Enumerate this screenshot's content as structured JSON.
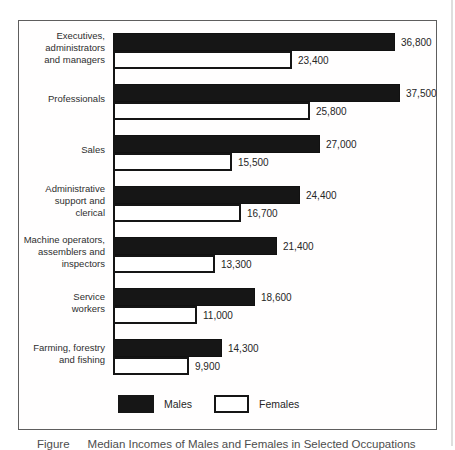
{
  "chart_data": {
    "type": "bar",
    "orientation": "horizontal",
    "categories": [
      [
        "Executives,",
        "administrators",
        "and managers"
      ],
      [
        "Professionals"
      ],
      [
        "Sales"
      ],
      [
        "Administrative",
        "support and",
        "clerical"
      ],
      [
        "Machine operators,",
        "assemblers and",
        "inspectors"
      ],
      [
        "Service",
        "workers"
      ],
      [
        "Farming, forestry",
        "and fishing"
      ]
    ],
    "series": [
      {
        "name": "Males",
        "values": [
          36800,
          37500,
          27000,
          24400,
          21400,
          18600,
          14300
        ],
        "value_labels": [
          "36,800",
          "37,500",
          "27,000",
          "24,400",
          "21,400",
          "18,600",
          "14,300"
        ],
        "fill": "#161616"
      },
      {
        "name": "Females",
        "values": [
          23400,
          25800,
          15500,
          16700,
          13300,
          11000,
          9900
        ],
        "value_labels": [
          "23,400",
          "25,800",
          "15,500",
          "16,700",
          "13,300",
          "11,000",
          "9,900"
        ],
        "fill": "#ffffff"
      }
    ],
    "xmax": 37500,
    "grid": false,
    "legend": [
      "Males",
      "Females"
    ],
    "legend_position": "bottom"
  },
  "caption": {
    "prefix": "Figure",
    "title": "Median Incomes of Males and Females in Selected Occupations"
  },
  "colors": {
    "bar_male": "#161616",
    "bar_female": "#ffffff",
    "bar_border": "#141414",
    "panel_border": "#5e5e5e",
    "text": "#2e2e2e",
    "caption_text": "#4d4d4d"
  }
}
